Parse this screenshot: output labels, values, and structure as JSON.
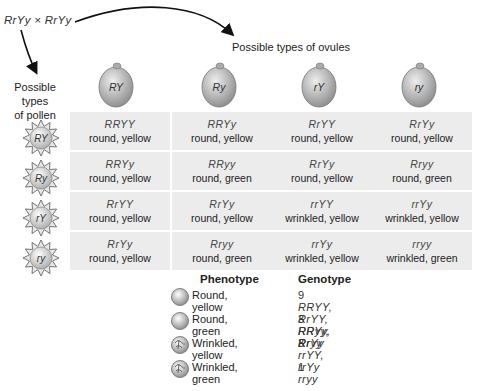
{
  "cross": "RrYy × RrYy",
  "ovule_title": "Possible types of ovules",
  "pollen_title_line1": "Possible types",
  "pollen_title_line2": "of pollen",
  "ovules": [
    "RY",
    "Ry",
    "rY",
    "ry"
  ],
  "pollen": [
    "RY",
    "Ry",
    "rY",
    "ry"
  ],
  "grid": [
    [
      {
        "g": "RRYY",
        "p": "round, yellow"
      },
      {
        "g": "RRYy",
        "p": "round, yellow"
      },
      {
        "g": "RrYY",
        "p": "round, yellow"
      },
      {
        "g": "RrYy",
        "p": "round, yellow"
      }
    ],
    [
      {
        "g": "RRYy",
        "p": "round, yellow"
      },
      {
        "g": "RRyy",
        "p": "round, green"
      },
      {
        "g": "RrYy",
        "p": "round, yellow"
      },
      {
        "g": "Rryy",
        "p": "round, green"
      }
    ],
    [
      {
        "g": "RrYY",
        "p": "round, yellow"
      },
      {
        "g": "RrYy",
        "p": "round, yellow"
      },
      {
        "g": "rrYY",
        "p": "wrinkled, yellow"
      },
      {
        "g": "rrYy",
        "p": "wrinkled, yellow"
      }
    ],
    [
      {
        "g": "RrYy",
        "p": "round, yellow"
      },
      {
        "g": "Rryy",
        "p": "round, green"
      },
      {
        "g": "rrYy",
        "p": "wrinkled, yellow"
      },
      {
        "g": "rryy",
        "p": "wrinkled, green"
      }
    ]
  ],
  "legend": {
    "phenotype_header": "Phenotype",
    "genotype_header": "Genotype",
    "rows": [
      {
        "icon": "round-seed-icon",
        "phenotype": "Round, yellow",
        "count": "9",
        "genotypes": "RRYY, RrYY, RRYy, RrYy"
      },
      {
        "icon": "round-seed-icon",
        "phenotype": "Round, green",
        "count": "3",
        "genotypes": "RRyy, Rryy"
      },
      {
        "icon": "wrinkled-seed-icon",
        "phenotype": "Wrinkled, yellow",
        "count": "3",
        "genotypes": "rrYY, rrYy"
      },
      {
        "icon": "wrinkled-seed-icon",
        "phenotype": "Wrinkled, green",
        "count": "1",
        "genotypes": "rryy"
      }
    ]
  },
  "colors": {
    "cell_bg": "#ececec",
    "seed_gray": "#b5b5b5"
  }
}
